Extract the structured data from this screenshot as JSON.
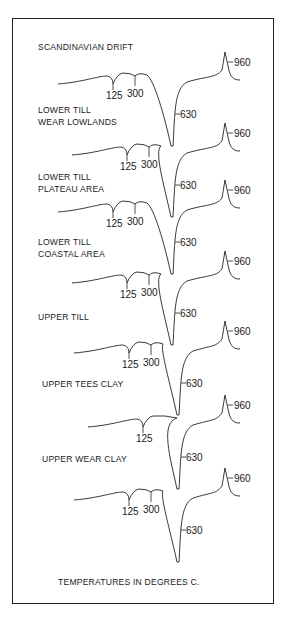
{
  "footer": "TEMPERATURES IN DEGREES C.",
  "curves": [
    {
      "label": [
        "SCANDINAVIAN DRIFT"
      ],
      "label_y": 50,
      "base_y": 84,
      "peaks": {
        "t125": "125",
        "t300": "300",
        "t630": "630",
        "t960": "960"
      },
      "has300": true
    },
    {
      "label": [
        "LOWER TILL",
        "WEAR LOWLANDS"
      ],
      "label_y": 113,
      "base_y": 155,
      "peaks": {
        "t125": "125",
        "t300": "300",
        "t630": "630",
        "t960": "960"
      },
      "has300": true
    },
    {
      "label": [
        "LOWER TILL",
        "PLATEAU AREA"
      ],
      "label_y": 180,
      "base_y": 212,
      "peaks": {
        "t125": "125",
        "t300": "300",
        "t630": "630",
        "t960": "960"
      },
      "has300": true
    },
    {
      "label": [
        "LOWER TILL",
        "COASTAL AREA"
      ],
      "label_y": 245,
      "base_y": 283,
      "peaks": {
        "t125": "125",
        "t300": "300",
        "t630": "630",
        "t960": "960"
      },
      "has300": true
    },
    {
      "label": [
        "UPPER TILL"
      ],
      "label_y": 320,
      "base_y": 353,
      "peaks": {
        "t125": "125",
        "t300": "300",
        "t630": "630",
        "t960": "960"
      },
      "has300": true
    },
    {
      "label": [
        "UPPER TEES CLAY"
      ],
      "label_y": 387,
      "base_y": 427,
      "peaks": {
        "t125": "125",
        "t300": "",
        "t630": "630",
        "t960": "960"
      },
      "has300": false
    },
    {
      "label": [
        "UPPER WEAR CLAY"
      ],
      "label_y": 462,
      "base_y": 500,
      "peaks": {
        "t125": "125",
        "t300": "300",
        "t630": "630",
        "t960": "960"
      },
      "has300": true
    }
  ],
  "chart_data": {
    "type": "line",
    "xlabel": "TEMPERATURES IN DEGREES C.",
    "annotated_temperatures": [
      125,
      300,
      630,
      960
    ],
    "series": [
      {
        "name": "SCANDINAVIAN DRIFT",
        "peaks": [
          125,
          300,
          630,
          960
        ]
      },
      {
        "name": "LOWER TILL WEAR LOWLANDS",
        "peaks": [
          125,
          300,
          630,
          960
        ]
      },
      {
        "name": "LOWER TILL PLATEAU AREA",
        "peaks": [
          125,
          300,
          630,
          960
        ]
      },
      {
        "name": "LOWER TILL COASTAL AREA",
        "peaks": [
          125,
          300,
          630,
          960
        ]
      },
      {
        "name": "UPPER TILL",
        "peaks": [
          125,
          300,
          630,
          960
        ]
      },
      {
        "name": "UPPER TEES CLAY",
        "peaks": [
          125,
          630,
          960
        ]
      },
      {
        "name": "UPPER WEAR CLAY",
        "peaks": [
          125,
          300,
          630,
          960
        ]
      }
    ]
  }
}
